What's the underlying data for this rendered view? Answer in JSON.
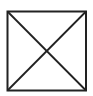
{
  "diagram": {
    "shape": "square-with-diagonals",
    "stroke_color": "#222222",
    "background_color": "#ffffff",
    "square": {
      "x": 7.5,
      "y": 11.5,
      "width": 78.5,
      "height": 79
    },
    "stroke_width": 2
  }
}
